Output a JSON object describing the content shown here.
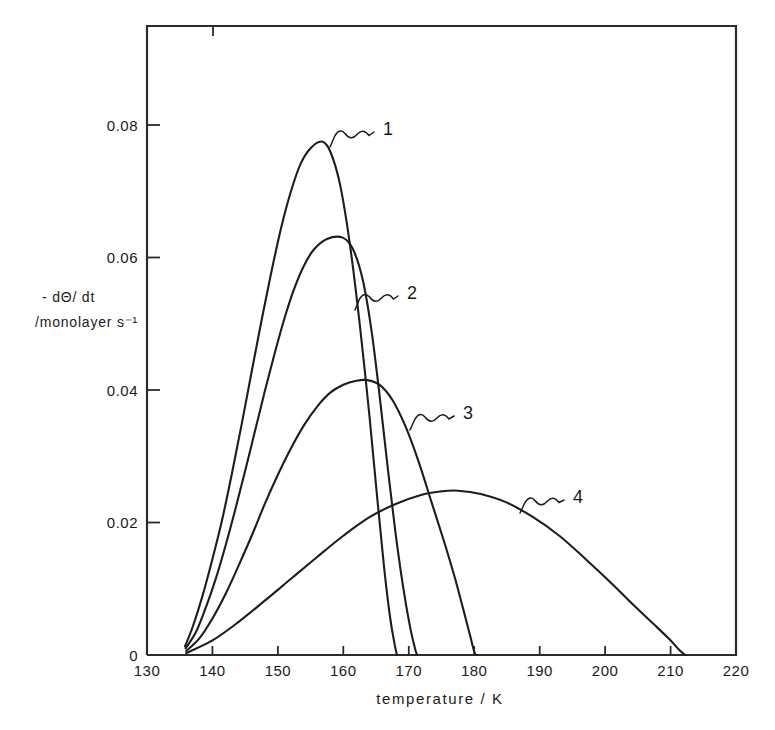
{
  "chart_data": {
    "type": "line",
    "title": "",
    "xlabel": "temperature / K",
    "ylabel_line1": "- dΘ/ dt",
    "ylabel_line2": "/monolayer s⁻¹",
    "xlim": [
      130,
      220
    ],
    "ylim": [
      0,
      0.09
    ],
    "x_ticks": [
      130,
      140,
      150,
      160,
      170,
      180,
      190,
      200,
      210,
      220
    ],
    "x_tick_labels": [
      "130",
      "140",
      "150",
      "160",
      "170",
      "180",
      "190",
      "200",
      "210",
      "220"
    ],
    "y_ticks": [
      0,
      0.02,
      0.04,
      0.06,
      0.08
    ],
    "y_tick_labels": [
      "0",
      "0.02",
      "0.04",
      "0.06",
      "0.08"
    ],
    "grid": false,
    "legend_position": "inline-annotations",
    "series": [
      {
        "name": "1",
        "label": "1",
        "label_position": {
          "x": 193,
          "y": 120
        },
        "peak": {
          "x": 156.7,
          "y": 0.0775
        },
        "points": [
          [
            135.8,
            0.0013
          ],
          [
            137.0,
            0.0043
          ],
          [
            138.5,
            0.009
          ],
          [
            140.0,
            0.0145
          ],
          [
            141.5,
            0.0205
          ],
          [
            143.0,
            0.0275
          ],
          [
            144.5,
            0.035
          ],
          [
            146.0,
            0.0428
          ],
          [
            147.5,
            0.0505
          ],
          [
            149.0,
            0.0578
          ],
          [
            150.5,
            0.0645
          ],
          [
            152.0,
            0.07
          ],
          [
            153.5,
            0.0742
          ],
          [
            155.0,
            0.0765
          ],
          [
            156.7,
            0.0775
          ],
          [
            158.0,
            0.076
          ],
          [
            159.5,
            0.071
          ],
          [
            161.0,
            0.062
          ],
          [
            162.5,
            0.05
          ],
          [
            164.0,
            0.036
          ],
          [
            165.2,
            0.0235
          ],
          [
            166.2,
            0.0135
          ],
          [
            167.1,
            0.006
          ],
          [
            167.8,
            0.0018
          ],
          [
            168.2,
            0.0
          ]
        ]
      },
      {
        "name": "2",
        "label": "2",
        "label_position": {
          "x": 215,
          "y": 0.0555
        },
        "peak": {
          "x": 159.9,
          "y": 0.063
        },
        "points": [
          [
            135.9,
            0.001
          ],
          [
            137.5,
            0.0035
          ],
          [
            139.0,
            0.0072
          ],
          [
            140.5,
            0.0115
          ],
          [
            142.0,
            0.0165
          ],
          [
            143.5,
            0.022
          ],
          [
            145.0,
            0.0278
          ],
          [
            146.5,
            0.0338
          ],
          [
            148.0,
            0.0398
          ],
          [
            149.5,
            0.0455
          ],
          [
            151.0,
            0.0508
          ],
          [
            152.5,
            0.0553
          ],
          [
            154.0,
            0.0588
          ],
          [
            155.5,
            0.0612
          ],
          [
            157.5,
            0.0628
          ],
          [
            159.9,
            0.063
          ],
          [
            161.5,
            0.0612
          ],
          [
            163.0,
            0.0565
          ],
          [
            164.3,
            0.049
          ],
          [
            165.5,
            0.0395
          ],
          [
            166.7,
            0.029
          ],
          [
            167.9,
            0.019
          ],
          [
            169.1,
            0.0105
          ],
          [
            170.2,
            0.0042
          ],
          [
            171.0,
            0.0008
          ],
          [
            171.3,
            0.0
          ]
        ]
      },
      {
        "name": "3",
        "label": "3",
        "label_position": {
          "x": 246,
          "y": 0.0415
        },
        "peak": {
          "x": 163.6,
          "y": 0.0415
        },
        "points": [
          [
            136.0,
            0.0006
          ],
          [
            138.0,
            0.0025
          ],
          [
            140.0,
            0.0055
          ],
          [
            142.0,
            0.0092
          ],
          [
            144.0,
            0.0135
          ],
          [
            146.0,
            0.018
          ],
          [
            148.0,
            0.0228
          ],
          [
            150.0,
            0.0272
          ],
          [
            152.0,
            0.0312
          ],
          [
            154.0,
            0.0347
          ],
          [
            156.0,
            0.0375
          ],
          [
            158.0,
            0.0396
          ],
          [
            160.0,
            0.0408
          ],
          [
            162.0,
            0.0414
          ],
          [
            163.6,
            0.0415
          ],
          [
            165.5,
            0.0408
          ],
          [
            167.5,
            0.0385
          ],
          [
            169.5,
            0.0345
          ],
          [
            171.5,
            0.0292
          ],
          [
            173.5,
            0.023
          ],
          [
            175.5,
            0.0168
          ],
          [
            177.0,
            0.0118
          ],
          [
            178.3,
            0.007
          ],
          [
            179.3,
            0.0032
          ],
          [
            180.0,
            0.0005
          ],
          [
            180.3,
            0.0
          ]
        ]
      },
      {
        "name": "4",
        "label": "4",
        "label_position": {
          "x": 305,
          "y": 0.0275
        },
        "peak": {
          "x": 177.5,
          "y": 0.0248
        },
        "points": [
          [
            136.0,
            0.0003
          ],
          [
            140.0,
            0.0022
          ],
          [
            144.0,
            0.005
          ],
          [
            148.0,
            0.0082
          ],
          [
            152.0,
            0.0115
          ],
          [
            156.0,
            0.0148
          ],
          [
            160.0,
            0.018
          ],
          [
            164.0,
            0.0208
          ],
          [
            168.0,
            0.0228
          ],
          [
            172.0,
            0.0242
          ],
          [
            175.0,
            0.0247
          ],
          [
            177.5,
            0.0248
          ],
          [
            181.0,
            0.0243
          ],
          [
            185.0,
            0.023
          ],
          [
            189.0,
            0.0208
          ],
          [
            193.0,
            0.018
          ],
          [
            197.0,
            0.0145
          ],
          [
            201.0,
            0.0108
          ],
          [
            204.5,
            0.0074
          ],
          [
            207.5,
            0.0046
          ],
          [
            209.8,
            0.0024
          ],
          [
            211.3,
            0.0008
          ],
          [
            212.2,
            0.0
          ]
        ]
      }
    ]
  },
  "caption": {
    "partial_text": ""
  }
}
